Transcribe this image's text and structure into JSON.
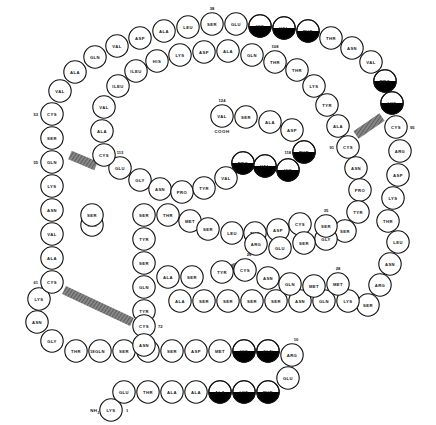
{
  "diagram": {
    "type": "protein-sequence-schematic",
    "colors": {
      "outline": "#111111",
      "circle_fill": "#ffffff",
      "highlight_fill": "#000000",
      "stipple_fill": "#9a9a9a",
      "bond_fill": "#8a8a8a"
    },
    "termini": {
      "n_terminus": "NH",
      "n_terminus_sub": "2",
      "c_terminus": "COOH"
    },
    "legend_note": "Filled (black) half-circles mark hydrophobic / highlighted residues; hatched bars mark disulfide bridges.",
    "residues": [
      {
        "label": "LYS",
        "x": 111,
        "y": 410,
        "num": "1",
        "numpos": "right",
        "fill": "none"
      },
      {
        "label": "GLU",
        "x": 124,
        "y": 392,
        "num": "",
        "numpos": "",
        "fill": "none"
      },
      {
        "label": "THR",
        "x": 148,
        "y": 392,
        "num": "",
        "numpos": "",
        "fill": "none"
      },
      {
        "label": "ALA",
        "x": 172,
        "y": 392,
        "num": "",
        "numpos": "",
        "fill": "none"
      },
      {
        "label": "ALA",
        "x": 196,
        "y": 392,
        "num": "",
        "numpos": "",
        "fill": "none"
      },
      {
        "label": "ALA",
        "x": 220,
        "y": 392,
        "num": "",
        "numpos": "",
        "fill": "half"
      },
      {
        "label": "LYS",
        "x": 244,
        "y": 392,
        "num": "",
        "numpos": "",
        "fill": "half"
      },
      {
        "label": "PHE",
        "x": 268,
        "y": 392,
        "num": "",
        "numpos": "",
        "fill": "half"
      },
      {
        "label": "GLU",
        "x": 288,
        "y": 378,
        "num": "",
        "numpos": "",
        "fill": "none"
      },
      {
        "label": "ARG",
        "x": 292,
        "y": 355,
        "num": "10",
        "numpos": "upright",
        "fill": "none"
      },
      {
        "label": "GLN",
        "x": 268,
        "y": 351,
        "num": "",
        "numpos": "",
        "fill": "half"
      },
      {
        "label": "HIS",
        "x": 244,
        "y": 351,
        "num": "",
        "numpos": "",
        "fill": "half"
      },
      {
        "label": "MET",
        "x": 220,
        "y": 351,
        "num": "",
        "numpos": "",
        "fill": "none"
      },
      {
        "label": "ASP",
        "x": 196,
        "y": 351,
        "num": "",
        "numpos": "",
        "fill": "none"
      },
      {
        "label": "SER",
        "x": 172,
        "y": 351,
        "num": "",
        "numpos": "",
        "fill": "none"
      },
      {
        "label": "THR",
        "x": 148,
        "y": 351,
        "num": "",
        "numpos": "",
        "fill": "none"
      },
      {
        "label": "SER",
        "x": 124,
        "y": 351,
        "num": "",
        "numpos": "",
        "fill": "none"
      },
      {
        "label": "GLN",
        "x": 100,
        "y": 351,
        "num": "",
        "numpos": "",
        "fill": "none"
      },
      {
        "label": "THR",
        "x": 76,
        "y": 351,
        "num": "18",
        "numpos": "right",
        "fill": "none"
      },
      {
        "label": "GLY",
        "x": 52,
        "y": 341,
        "num": "",
        "numpos": "",
        "fill": "none"
      },
      {
        "label": "ASN",
        "x": 37,
        "y": 322,
        "num": "",
        "numpos": "",
        "fill": "none"
      },
      {
        "label": "LYS",
        "x": 39,
        "y": 299,
        "num": "",
        "numpos": "",
        "fill": "none"
      },
      {
        "label": "CYS",
        "x": 52,
        "y": 282,
        "num": "61",
        "numpos": "left",
        "fill": "none"
      },
      {
        "label": "ALA",
        "x": 52,
        "y": 258,
        "num": "",
        "numpos": "",
        "fill": "none"
      },
      {
        "label": "VAL",
        "x": 52,
        "y": 234,
        "num": "",
        "numpos": "",
        "fill": "none"
      },
      {
        "label": "ASN",
        "x": 52,
        "y": 210,
        "num": "",
        "numpos": "",
        "fill": "none"
      },
      {
        "label": "LYS",
        "x": 52,
        "y": 186,
        "num": "",
        "numpos": "",
        "fill": "none"
      },
      {
        "label": "GLN",
        "x": 52,
        "y": 162,
        "num": "55",
        "numpos": "left",
        "fill": "none"
      },
      {
        "label": "SER",
        "x": 52,
        "y": 138,
        "num": "",
        "numpos": "",
        "fill": "none"
      },
      {
        "label": "CYS",
        "x": 52,
        "y": 114,
        "num": "53",
        "numpos": "left",
        "fill": "none"
      },
      {
        "label": "VAL",
        "x": 60,
        "y": 91,
        "num": "",
        "numpos": "",
        "fill": "none"
      },
      {
        "label": "ALA",
        "x": 75,
        "y": 72,
        "num": "",
        "numpos": "",
        "fill": "none"
      },
      {
        "label": "GLN",
        "x": 95,
        "y": 57,
        "num": "",
        "numpos": "",
        "fill": "none"
      },
      {
        "label": "VAL",
        "x": 117,
        "y": 46,
        "num": "",
        "numpos": "",
        "fill": "none"
      },
      {
        "label": "ASP",
        "x": 140,
        "y": 38,
        "num": "",
        "numpos": "",
        "fill": "none"
      },
      {
        "label": "ALA",
        "x": 164,
        "y": 31,
        "num": "",
        "numpos": "",
        "fill": "none"
      },
      {
        "label": "LEU",
        "x": 188,
        "y": 27,
        "num": "",
        "numpos": "",
        "fill": "none"
      },
      {
        "label": "SER",
        "x": 212,
        "y": 24,
        "num": "38",
        "numpos": "up",
        "fill": "none"
      },
      {
        "label": "GLU",
        "x": 236,
        "y": 24,
        "num": "",
        "numpos": "",
        "fill": "none"
      },
      {
        "label": "HIS",
        "x": 260,
        "y": 26,
        "num": "",
        "numpos": "",
        "fill": "half"
      },
      {
        "label": "VAL",
        "x": 284,
        "y": 28,
        "num": "",
        "numpos": "",
        "fill": "half"
      },
      {
        "label": "PHE",
        "x": 308,
        "y": 31,
        "num": "",
        "numpos": "",
        "fill": "half"
      },
      {
        "label": "THR",
        "x": 331,
        "y": 38,
        "num": "",
        "numpos": "",
        "fill": "none"
      },
      {
        "label": "ASN",
        "x": 352,
        "y": 48,
        "num": "",
        "numpos": "",
        "fill": "none"
      },
      {
        "label": "VAL",
        "x": 371,
        "y": 62,
        "num": "",
        "numpos": "",
        "fill": "none"
      },
      {
        "label": "PRO",
        "x": 385,
        "y": 81,
        "num": "",
        "numpos": "",
        "fill": "half"
      },
      {
        "label": "LYS",
        "x": 392,
        "y": 103,
        "num": "",
        "numpos": "",
        "fill": "half"
      },
      {
        "label": "CYS",
        "x": 396,
        "y": 127,
        "num": "95",
        "numpos": "right",
        "fill": "none"
      },
      {
        "label": "ARG",
        "x": 400,
        "y": 151,
        "num": "",
        "numpos": "",
        "fill": "none"
      },
      {
        "label": "ASP",
        "x": 398,
        "y": 175,
        "num": "",
        "numpos": "",
        "fill": "none"
      },
      {
        "label": "LYS",
        "x": 393,
        "y": 198,
        "num": "",
        "numpos": "",
        "fill": "none"
      },
      {
        "label": "THR",
        "x": 388,
        "y": 221,
        "num": "",
        "numpos": "",
        "fill": "none"
      },
      {
        "label": "LEU",
        "x": 398,
        "y": 242,
        "num": "",
        "numpos": "",
        "fill": "none"
      },
      {
        "label": "ASN",
        "x": 390,
        "y": 264,
        "num": "",
        "numpos": "",
        "fill": "none"
      },
      {
        "label": "ARG",
        "x": 380,
        "y": 285,
        "num": "",
        "numpos": "",
        "fill": "none"
      },
      {
        "label": "SER",
        "x": 368,
        "y": 305,
        "num": "",
        "numpos": "",
        "fill": "none"
      },
      {
        "label": "LYS",
        "x": 348,
        "y": 301,
        "num": "",
        "numpos": "",
        "fill": "none"
      },
      {
        "label": "GLN",
        "x": 324,
        "y": 301,
        "num": "",
        "numpos": "",
        "fill": "none"
      },
      {
        "label": "ASN",
        "x": 300,
        "y": 301,
        "num": "",
        "numpos": "",
        "fill": "none"
      },
      {
        "label": "SER",
        "x": 276,
        "y": 301,
        "num": "",
        "numpos": "",
        "fill": "none"
      },
      {
        "label": "SER",
        "x": 252,
        "y": 301,
        "num": "",
        "numpos": "",
        "fill": "none"
      },
      {
        "label": "SER",
        "x": 228,
        "y": 301,
        "num": "",
        "numpos": "",
        "fill": "none"
      },
      {
        "label": "SER",
        "x": 204,
        "y": 301,
        "num": "",
        "numpos": "",
        "fill": "none"
      },
      {
        "label": "ALA",
        "x": 180,
        "y": 301,
        "num": "",
        "numpos": "",
        "fill": "none"
      },
      {
        "label": "GLN",
        "x": 144,
        "y": 287,
        "num": "",
        "numpos": "",
        "fill": "none"
      },
      {
        "label": "SER",
        "x": 144,
        "y": 263,
        "num": "",
        "numpos": "",
        "fill": "none"
      },
      {
        "label": "TYR",
        "x": 144,
        "y": 239,
        "num": "",
        "numpos": "",
        "fill": "none"
      },
      {
        "label": "SER",
        "x": 144,
        "y": 215,
        "num": "",
        "numpos": "",
        "fill": "none"
      },
      {
        "label": "THR",
        "x": 168,
        "y": 215,
        "num": "",
        "numpos": "",
        "fill": "none"
      },
      {
        "label": "MET",
        "x": 190,
        "y": 221,
        "num": "",
        "numpos": "",
        "fill": "none"
      },
      {
        "label": "SER",
        "x": 208,
        "y": 229,
        "num": "",
        "numpos": "",
        "fill": "none"
      },
      {
        "label": "LEU",
        "x": 232,
        "y": 233,
        "num": "",
        "numpos": "",
        "fill": "none"
      },
      {
        "label": "THR",
        "x": 255,
        "y": 233,
        "num": "",
        "numpos": "",
        "fill": "none"
      },
      {
        "label": "ASP",
        "x": 278,
        "y": 230,
        "num": "",
        "numpos": "",
        "fill": "none"
      },
      {
        "label": "CYS",
        "x": 300,
        "y": 224,
        "num": "",
        "numpos": "",
        "fill": "none"
      },
      {
        "label": "TYR",
        "x": 144,
        "y": 311,
        "num": "",
        "numpos": "",
        "fill": "none"
      },
      {
        "label": "CYS",
        "x": 144,
        "y": 326,
        "num": "72",
        "numpos": "right",
        "fill": "none"
      },
      {
        "label": "ASN",
        "x": 144,
        "y": 345,
        "num": "",
        "numpos": "",
        "fill": "none"
      },
      {
        "label": "CYS",
        "x": 245,
        "y": 270,
        "num": "26",
        "numpos": "upright",
        "fill": "none"
      },
      {
        "label": "ASN",
        "x": 268,
        "y": 278,
        "num": "",
        "numpos": "",
        "fill": "none"
      },
      {
        "label": "GLN",
        "x": 290,
        "y": 284,
        "num": "",
        "numpos": "",
        "fill": "none"
      },
      {
        "label": "MET",
        "x": 314,
        "y": 286,
        "num": "",
        "numpos": "",
        "fill": "none"
      },
      {
        "label": "MET",
        "x": 338,
        "y": 284,
        "num": "28",
        "numpos": "up",
        "fill": "none"
      },
      {
        "label": "TYR",
        "x": 222,
        "y": 272,
        "num": "",
        "numpos": "",
        "fill": "none"
      },
      {
        "label": "GLU",
        "x": 120,
        "y": 168,
        "num": "113",
        "numpos": "up",
        "fill": "none"
      },
      {
        "label": "GLY",
        "x": 140,
        "y": 180,
        "num": "",
        "numpos": "",
        "fill": "none"
      },
      {
        "label": "ASN",
        "x": 160,
        "y": 189,
        "num": "",
        "numpos": "",
        "fill": "none"
      },
      {
        "label": "PRO",
        "x": 182,
        "y": 192,
        "num": "",
        "numpos": "",
        "fill": "none"
      },
      {
        "label": "TYR",
        "x": 204,
        "y": 188,
        "num": "",
        "numpos": "",
        "fill": "none"
      },
      {
        "label": "VAL",
        "x": 226,
        "y": 178,
        "num": "",
        "numpos": "",
        "fill": "none"
      },
      {
        "label": "PRO",
        "x": 243,
        "y": 163,
        "num": "",
        "numpos": "",
        "fill": "half"
      },
      {
        "label": "VAL",
        "x": 265,
        "y": 166,
        "num": "",
        "numpos": "",
        "fill": "half"
      },
      {
        "label": "HIS",
        "x": 288,
        "y": 170,
        "num": "",
        "numpos": "",
        "fill": "half"
      },
      {
        "label": "PHE",
        "x": 304,
        "y": 152,
        "num": "118",
        "numpos": "left",
        "fill": "half"
      },
      {
        "label": "ASP",
        "x": 292,
        "y": 130,
        "num": "",
        "numpos": "",
        "fill": "none"
      },
      {
        "label": "ALA",
        "x": 270,
        "y": 122,
        "num": "",
        "numpos": "",
        "fill": "none"
      },
      {
        "label": "SER",
        "x": 246,
        "y": 117,
        "num": "",
        "numpos": "",
        "fill": "none"
      },
      {
        "label": "VAL",
        "x": 222,
        "y": 116,
        "num": "124",
        "numpos": "up",
        "fill": "none"
      },
      {
        "label": "CYS",
        "x": 104,
        "y": 155,
        "num": "",
        "numpos": "",
        "fill": "none"
      },
      {
        "label": "ALA",
        "x": 102,
        "y": 131,
        "num": "",
        "numpos": "",
        "fill": "none"
      },
      {
        "label": "VAL",
        "x": 104,
        "y": 107,
        "num": "",
        "numpos": "",
        "fill": "none"
      },
      {
        "label": "ILEU",
        "x": 118,
        "y": 86,
        "num": "",
        "numpos": "",
        "fill": "none"
      },
      {
        "label": "ILEU",
        "x": 136,
        "y": 71,
        "num": "",
        "numpos": "",
        "fill": "none"
      },
      {
        "label": "HIS",
        "x": 157,
        "y": 61,
        "num": "",
        "numpos": "",
        "fill": "none"
      },
      {
        "label": "LYS",
        "x": 180,
        "y": 55,
        "num": "",
        "numpos": "",
        "fill": "none"
      },
      {
        "label": "ASP",
        "x": 204,
        "y": 52,
        "num": "",
        "numpos": "",
        "fill": "none"
      },
      {
        "label": "ALA",
        "x": 228,
        "y": 51,
        "num": "",
        "numpos": "",
        "fill": "none"
      },
      {
        "label": "GLN",
        "x": 252,
        "y": 55,
        "num": "",
        "numpos": "",
        "fill": "none"
      },
      {
        "label": "THR",
        "x": 275,
        "y": 62,
        "num": "108",
        "numpos": "up",
        "fill": "none"
      },
      {
        "label": "THR",
        "x": 297,
        "y": 70,
        "num": "",
        "numpos": "",
        "fill": "none"
      },
      {
        "label": "LYS",
        "x": 314,
        "y": 86,
        "num": "",
        "numpos": "",
        "fill": "none"
      },
      {
        "label": "TYR",
        "x": 327,
        "y": 105,
        "num": "",
        "numpos": "",
        "fill": "none"
      },
      {
        "label": "ALA",
        "x": 338,
        "y": 126,
        "num": "",
        "numpos": "",
        "fill": "none"
      },
      {
        "label": "CYS",
        "x": 348,
        "y": 147,
        "num": "91",
        "numpos": "left",
        "fill": "none"
      },
      {
        "label": "ASN",
        "x": 356,
        "y": 168,
        "num": "",
        "numpos": "",
        "fill": "none"
      },
      {
        "label": "PRO",
        "x": 360,
        "y": 190,
        "num": "",
        "numpos": "",
        "fill": "none"
      },
      {
        "label": "TYR",
        "x": 358,
        "y": 212,
        "num": "",
        "numpos": "",
        "fill": "none"
      },
      {
        "label": "SER",
        "x": 345,
        "y": 231,
        "num": "",
        "numpos": "",
        "fill": "none"
      },
      {
        "label": "GLY",
        "x": 326,
        "y": 239,
        "num": "",
        "numpos": "",
        "fill": "none"
      },
      {
        "label": "SER",
        "x": 304,
        "y": 243,
        "num": "",
        "numpos": "",
        "fill": "none"
      },
      {
        "label": "SER",
        "x": 326,
        "y": 226,
        "num": "35",
        "numpos": "up",
        "fill": "none"
      },
      {
        "label": "ARG",
        "x": 256,
        "y": 244,
        "num": "",
        "numpos": "",
        "fill": "none"
      },
      {
        "label": "GLU",
        "x": 280,
        "y": 248,
        "num": "",
        "numpos": "",
        "fill": "none"
      },
      {
        "label": "THR",
        "x": 92,
        "y": 225,
        "num": "",
        "numpos": "",
        "fill": "none"
      },
      {
        "label": "SER",
        "x": 92,
        "y": 215,
        "num": "",
        "numpos": "",
        "fill": "none"
      },
      {
        "label": "ALA",
        "x": 168,
        "y": 277,
        "num": "",
        "numpos": "",
        "fill": "none"
      },
      {
        "label": "SER",
        "x": 192,
        "y": 277,
        "num": "",
        "numpos": "",
        "fill": "none"
      }
    ],
    "disulfide_bonds": [
      {
        "x1": 70,
        "y1": 155,
        "x2": 96,
        "y2": 166,
        "label": "bond-53-113"
      },
      {
        "x1": 64,
        "y1": 290,
        "x2": 132,
        "y2": 322,
        "label": "bond-61-72"
      },
      {
        "x1": 240,
        "y1": 266,
        "x2": 222,
        "y2": 272,
        "label": "bond-26"
      },
      {
        "x1": 356,
        "y1": 135,
        "x2": 382,
        "y2": 117,
        "label": "bond-91-95"
      }
    ]
  }
}
